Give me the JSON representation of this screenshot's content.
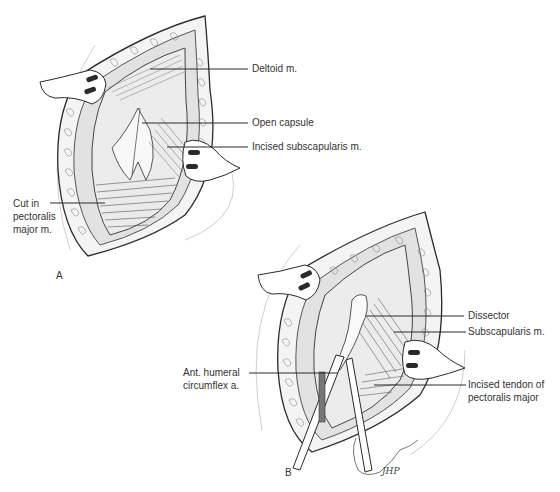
{
  "figure": {
    "panels": [
      {
        "id": "A",
        "letter": "A",
        "labels": {
          "deltoid": "Deltoid m.",
          "open_capsule": "Open capsule",
          "incised_subscapularis": "Incised subscapularis m.",
          "cut_pectoralis_line1": "Cut in",
          "cut_pectoralis_line2": "pectoralis",
          "cut_pectoralis_line3": "major m."
        }
      },
      {
        "id": "B",
        "letter": "B",
        "labels": {
          "dissector": "Dissector",
          "subscapularis": "Subscapularis m.",
          "ant_humeral_line1": "Ant. humeral",
          "ant_humeral_line2": "circumflex a.",
          "incised_tendon_line1": "Incised tendon of",
          "incised_tendon_line2": "pectoralis major"
        }
      }
    ],
    "signature": "JHP"
  },
  "colors": {
    "ink": "#2a2a2a",
    "shade": "#8a8a8a",
    "light": "#d9d9d9",
    "background": "#ffffff"
  }
}
